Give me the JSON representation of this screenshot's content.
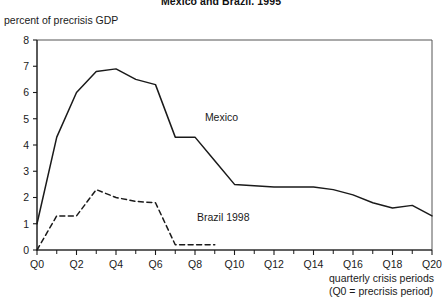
{
  "chart_data": {
    "type": "line",
    "title": "Mexico and Brazil, 1995",
    "ylabel": "percent of precrisis GDP",
    "xlabel": "quarterly crisis periods",
    "xlabel_note": "(Q0 = precrisis period)",
    "ylim": [
      0,
      8
    ],
    "xlim": [
      0,
      20
    ],
    "grid": false,
    "legend_position": "inline-annotation",
    "ytick_labels": [
      "0",
      "1",
      "2",
      "3",
      "4",
      "5",
      "6",
      "7",
      "8"
    ],
    "ytick_values": [
      0,
      1,
      2,
      3,
      4,
      5,
      6,
      7,
      8
    ],
    "xtick_labels": [
      "Q0",
      "Q2",
      "Q4",
      "Q6",
      "Q8",
      "Q10",
      "Q12",
      "Q14",
      "Q16",
      "Q18",
      "Q20"
    ],
    "xtick_values": [
      0,
      2,
      4,
      6,
      8,
      10,
      12,
      14,
      16,
      18,
      20
    ],
    "xtick_minor_values": [
      1,
      3,
      5,
      7,
      9,
      11,
      13,
      15,
      17,
      19
    ],
    "series": [
      {
        "name": "Mexico",
        "style": "solid",
        "color": "#1a1a1a",
        "x": [
          0,
          1,
          2,
          3,
          4,
          5,
          6,
          7,
          8,
          9,
          10,
          11,
          12,
          13,
          14,
          15,
          16,
          17,
          18,
          19,
          20
        ],
        "values": [
          1.0,
          4.3,
          6.0,
          6.8,
          6.9,
          6.5,
          6.3,
          4.3,
          4.3,
          3.4,
          2.5,
          2.45,
          2.4,
          2.4,
          2.4,
          2.3,
          2.1,
          1.8,
          1.6,
          1.7,
          1.3
        ],
        "label_x": 8.5,
        "label_y": 4.9
      },
      {
        "name": "Brazil 1998",
        "style": "dashed",
        "color": "#1a1a1a",
        "x": [
          0,
          1,
          2,
          3,
          4,
          5,
          6,
          7,
          8,
          9
        ],
        "values": [
          0.0,
          1.3,
          1.3,
          2.3,
          2.0,
          1.85,
          1.8,
          0.2,
          0.2,
          0.2
        ],
        "label_x": 8.1,
        "label_y": 1.1
      }
    ]
  }
}
